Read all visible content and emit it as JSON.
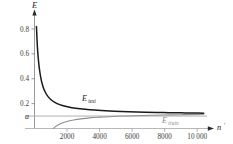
{
  "chart_data": {
    "type": "line",
    "title": "",
    "xlabel": "n'",
    "ylabel": "E",
    "xlim": [
      0,
      10600
    ],
    "ylim": [
      0,
      0.92
    ],
    "grid": false,
    "legend_position": "inline-annotation",
    "x_ticks": [
      {
        "value": 2000,
        "label": "2000"
      },
      {
        "value": 4000,
        "label": "4000"
      },
      {
        "value": 6000,
        "label": "6000"
      },
      {
        "value": 8000,
        "label": "8000"
      },
      {
        "value": 10000,
        "label": "10 000"
      }
    ],
    "y_ticks": [
      {
        "value": 0.8,
        "label": "0.8"
      },
      {
        "value": 0.6,
        "label": "0.6"
      },
      {
        "value": 0.4,
        "label": "0.4"
      },
      {
        "value": 0.2,
        "label": "0.2"
      },
      {
        "value": 0.1,
        "label": "a"
      }
    ],
    "asymptote": {
      "value": 0.1,
      "label": "a",
      "color": "#9a9a9a"
    },
    "series": [
      {
        "name": "E_test",
        "label": "E",
        "label_subscript": "test",
        "color": "#1a1a1a",
        "x": [
          120,
          160,
          200,
          260,
          330,
          420,
          520,
          650,
          800,
          1000,
          1250,
          1550,
          1900,
          2300,
          2800,
          3400,
          4100,
          4900,
          5800,
          6800,
          7900,
          9000,
          10000,
          10400
        ],
        "y": [
          0.82,
          0.7,
          0.615,
          0.525,
          0.452,
          0.387,
          0.338,
          0.295,
          0.262,
          0.233,
          0.21,
          0.192,
          0.178,
          0.167,
          0.158,
          0.15,
          0.144,
          0.139,
          0.135,
          0.131,
          0.128,
          0.126,
          0.124,
          0.123
        ]
      },
      {
        "name": "E_train",
        "label": "E",
        "label_subscript": "train",
        "color": "#8f8f8f",
        "x": [
          1150,
          1300,
          1500,
          1750,
          2050,
          2400,
          2850,
          3400,
          4050,
          4800,
          5700,
          6700,
          7800,
          9000,
          10000,
          10400
        ],
        "y": [
          0.0,
          0.016,
          0.032,
          0.046,
          0.058,
          0.068,
          0.077,
          0.085,
          0.091,
          0.097,
          0.101,
          0.105,
          0.108,
          0.111,
          0.113,
          0.114
        ]
      }
    ]
  },
  "labels": {
    "y_axis_title": "E",
    "x_axis_title": "n",
    "x_axis_prime": "'",
    "asymptote_label": "a",
    "test_label": "E",
    "test_subscript": "test",
    "train_label": "E",
    "train_subscript": "train",
    "tick_08": "0.8",
    "tick_06": "0.6",
    "tick_04": "0.4",
    "tick_02": "0.2",
    "tick_2000": "2000",
    "tick_4000": "4000",
    "tick_6000": "6000",
    "tick_8000": "8000",
    "tick_10000": "10 000"
  },
  "colors": {
    "test_curve": "#1a1a1a",
    "train_curve": "#8f8f8f",
    "axis": "#6e6e6e",
    "asymptote": "#9a9a9a",
    "background": "#ffffff"
  }
}
